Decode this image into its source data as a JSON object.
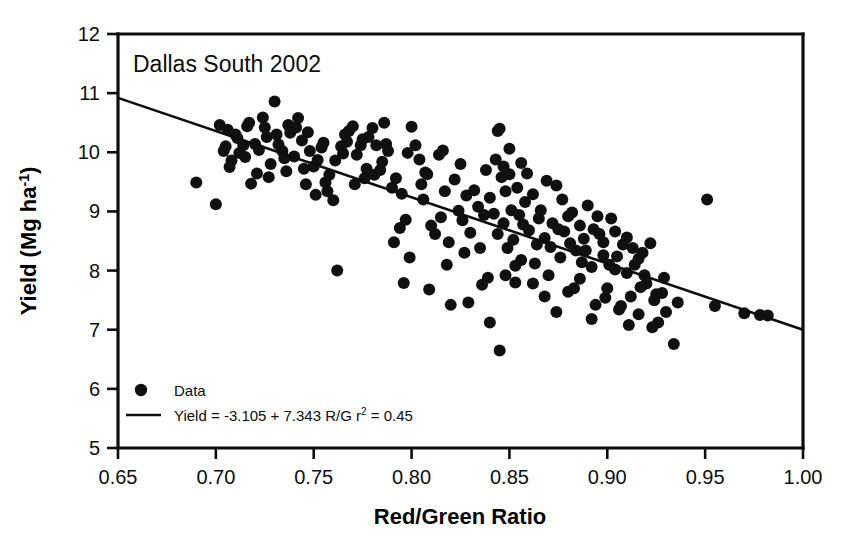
{
  "chart_data": {
    "type": "scatter",
    "title": "Dallas South 2002",
    "xlabel": "Red/Green Ratio",
    "ylabel": "Yield (Mg ha",
    "ylabel_sup": "-1",
    "ylabel_close": ")",
    "xlim": [
      0.65,
      1.0
    ],
    "ylim": [
      5,
      12
    ],
    "xticks": [
      0.65,
      0.7,
      0.75,
      0.8,
      0.85,
      0.9,
      0.95,
      1.0
    ],
    "xticklabels": [
      "0.65",
      "0.70",
      "0.75",
      "0.80",
      "0.85",
      "0.90",
      "0.95",
      "1.00"
    ],
    "yticks": [
      5,
      6,
      7,
      8,
      9,
      10,
      11,
      12
    ],
    "yticklabels": [
      "5",
      "6",
      "7",
      "8",
      "9",
      "10",
      "11",
      "12"
    ],
    "grid": false,
    "legend_position": "lower-left-inside",
    "legend": [
      {
        "marker": "circle",
        "label": "Data"
      },
      {
        "marker": "line",
        "label": "Yield = -3.105 + 7.343 R/G r",
        "sup": "2",
        "label_tail": " = 0.45"
      }
    ],
    "fit": {
      "intercept": -3.105,
      "slope": 7.343,
      "r_squared": 0.45,
      "equation_text": "Yield = -3.105 + 7.343 R/G r2 = 0.45",
      "line_endpoints": [
        [
          0.65,
          10.92
        ],
        [
          1.0,
          7.0
        ]
      ]
    },
    "series": [
      {
        "name": "Data",
        "marker": "filled-circle",
        "color": "#101010",
        "points": [
          [
            0.69,
            9.49
          ],
          [
            0.7,
            9.12
          ],
          [
            0.702,
            10.46
          ],
          [
            0.704,
            10.02
          ],
          [
            0.706,
            10.38
          ],
          [
            0.708,
            9.86
          ],
          [
            0.71,
            10.3
          ],
          [
            0.712,
            9.99
          ],
          [
            0.714,
            10.12
          ],
          [
            0.716,
            10.44
          ],
          [
            0.718,
            9.47
          ],
          [
            0.72,
            10.14
          ],
          [
            0.722,
            10.04
          ],
          [
            0.724,
            10.59
          ],
          [
            0.726,
            10.26
          ],
          [
            0.728,
            9.8
          ],
          [
            0.73,
            10.86
          ],
          [
            0.732,
            10.13
          ],
          [
            0.734,
            10.02
          ],
          [
            0.736,
            9.68
          ],
          [
            0.738,
            10.33
          ],
          [
            0.74,
            9.93
          ],
          [
            0.742,
            10.58
          ],
          [
            0.744,
            10.2
          ],
          [
            0.746,
            9.46
          ],
          [
            0.748,
            10.02
          ],
          [
            0.75,
            9.76
          ],
          [
            0.752,
            9.87
          ],
          [
            0.754,
            10.08
          ],
          [
            0.756,
            9.49
          ],
          [
            0.758,
            9.62
          ],
          [
            0.76,
            9.19
          ],
          [
            0.762,
            8.0
          ],
          [
            0.764,
            10.1
          ],
          [
            0.766,
            10.3
          ],
          [
            0.768,
            10.36
          ],
          [
            0.77,
            10.44
          ],
          [
            0.772,
            9.96
          ],
          [
            0.774,
            10.12
          ],
          [
            0.776,
            9.56
          ],
          [
            0.778,
            10.26
          ],
          [
            0.78,
            10.41
          ],
          [
            0.782,
            10.12
          ],
          [
            0.784,
            9.7
          ],
          [
            0.786,
            10.5
          ],
          [
            0.788,
            10.02
          ],
          [
            0.79,
            9.4
          ],
          [
            0.792,
            9.56
          ],
          [
            0.794,
            8.72
          ],
          [
            0.796,
            7.79
          ],
          [
            0.798,
            9.99
          ],
          [
            0.8,
            10.43
          ],
          [
            0.802,
            10.12
          ],
          [
            0.804,
            9.88
          ],
          [
            0.806,
            9.2
          ],
          [
            0.808,
            9.63
          ],
          [
            0.81,
            8.76
          ],
          [
            0.812,
            8.62
          ],
          [
            0.814,
            9.96
          ],
          [
            0.816,
            10.03
          ],
          [
            0.818,
            8.1
          ],
          [
            0.82,
            7.42
          ],
          [
            0.822,
            9.54
          ],
          [
            0.824,
            9.01
          ],
          [
            0.826,
            8.85
          ],
          [
            0.828,
            9.27
          ],
          [
            0.83,
            8.64
          ],
          [
            0.832,
            9.36
          ],
          [
            0.834,
            9.08
          ],
          [
            0.836,
            7.76
          ],
          [
            0.838,
            9.7
          ],
          [
            0.84,
            9.23
          ],
          [
            0.842,
            8.96
          ],
          [
            0.844,
            10.36
          ],
          [
            0.845,
            10.4
          ],
          [
            0.846,
            9.58
          ],
          [
            0.847,
            8.8
          ],
          [
            0.848,
            9.34
          ],
          [
            0.849,
            8.38
          ],
          [
            0.85,
            9.63
          ],
          [
            0.851,
            9.02
          ],
          [
            0.852,
            8.52
          ],
          [
            0.853,
            7.8
          ],
          [
            0.854,
            9.4
          ],
          [
            0.855,
            8.94
          ],
          [
            0.856,
            8.18
          ],
          [
            0.845,
            6.65
          ],
          [
            0.84,
            7.12
          ],
          [
            0.858,
            9.16
          ],
          [
            0.86,
            8.68
          ],
          [
            0.862,
            9.29
          ],
          [
            0.864,
            8.44
          ],
          [
            0.866,
            9.02
          ],
          [
            0.868,
            8.55
          ],
          [
            0.87,
            7.92
          ],
          [
            0.872,
            8.8
          ],
          [
            0.874,
            9.44
          ],
          [
            0.876,
            8.22
          ],
          [
            0.878,
            8.66
          ],
          [
            0.88,
            7.64
          ],
          [
            0.882,
            8.98
          ],
          [
            0.884,
            8.34
          ],
          [
            0.886,
            7.86
          ],
          [
            0.888,
            8.54
          ],
          [
            0.89,
            9.1
          ],
          [
            0.892,
            8.06
          ],
          [
            0.894,
            7.42
          ],
          [
            0.896,
            8.62
          ],
          [
            0.898,
            8.26
          ],
          [
            0.9,
            7.7
          ],
          [
            0.902,
            8.88
          ],
          [
            0.904,
            8.02
          ],
          [
            0.906,
            7.34
          ],
          [
            0.908,
            8.44
          ],
          [
            0.91,
            7.96
          ],
          [
            0.912,
            7.56
          ],
          [
            0.914,
            8.1
          ],
          [
            0.916,
            7.26
          ],
          [
            0.918,
            8.3
          ],
          [
            0.92,
            7.78
          ],
          [
            0.922,
            8.46
          ],
          [
            0.924,
            7.5
          ],
          [
            0.926,
            7.12
          ],
          [
            0.928,
            7.62
          ],
          [
            0.93,
            7.3
          ],
          [
            0.934,
            6.76
          ],
          [
            0.936,
            7.46
          ],
          [
            0.951,
            9.2
          ],
          [
            0.955,
            7.4
          ],
          [
            0.97,
            7.28
          ],
          [
            0.978,
            7.25
          ],
          [
            0.982,
            7.24
          ],
          [
            0.705,
            10.1
          ],
          [
            0.715,
            9.92
          ],
          [
            0.725,
            10.42
          ],
          [
            0.735,
            9.9
          ],
          [
            0.745,
            9.72
          ],
          [
            0.755,
            10.16
          ],
          [
            0.765,
            9.98
          ],
          [
            0.775,
            10.22
          ],
          [
            0.785,
            9.84
          ],
          [
            0.795,
            9.3
          ],
          [
            0.805,
            9.46
          ],
          [
            0.815,
            8.9
          ],
          [
            0.825,
            9.8
          ],
          [
            0.835,
            8.38
          ],
          [
            0.843,
            9.88
          ],
          [
            0.857,
            8.78
          ],
          [
            0.863,
            8.12
          ],
          [
            0.869,
            9.52
          ],
          [
            0.875,
            8.7
          ],
          [
            0.881,
            8.46
          ],
          [
            0.887,
            8.14
          ],
          [
            0.893,
            8.7
          ],
          [
            0.899,
            7.54
          ],
          [
            0.905,
            8.24
          ],
          [
            0.911,
            7.08
          ],
          [
            0.917,
            7.72
          ],
          [
            0.923,
            7.04
          ],
          [
            0.929,
            7.88
          ],
          [
            0.707,
            9.75
          ],
          [
            0.717,
            10.5
          ],
          [
            0.727,
            9.58
          ],
          [
            0.737,
            10.46
          ],
          [
            0.747,
            10.34
          ],
          [
            0.757,
            9.34
          ],
          [
            0.767,
            10.18
          ],
          [
            0.777,
            9.72
          ],
          [
            0.787,
            10.14
          ],
          [
            0.797,
            8.86
          ],
          [
            0.807,
            9.66
          ],
          [
            0.817,
            9.34
          ],
          [
            0.827,
            8.3
          ],
          [
            0.837,
            8.94
          ],
          [
            0.847,
            9.76
          ],
          [
            0.853,
            8.08
          ],
          [
            0.859,
            9.64
          ],
          [
            0.865,
            8.88
          ],
          [
            0.871,
            8.4
          ],
          [
            0.877,
            9.2
          ],
          [
            0.883,
            7.7
          ],
          [
            0.889,
            8.34
          ],
          [
            0.895,
            8.92
          ],
          [
            0.901,
            8.1
          ],
          [
            0.907,
            7.4
          ],
          [
            0.913,
            8.38
          ],
          [
            0.919,
            7.92
          ],
          [
            0.925,
            7.6
          ],
          [
            0.85,
            10.06
          ],
          [
            0.856,
            9.82
          ],
          [
            0.862,
            7.78
          ],
          [
            0.868,
            7.56
          ],
          [
            0.874,
            7.3
          ],
          [
            0.88,
            8.92
          ],
          [
            0.886,
            8.76
          ],
          [
            0.892,
            7.18
          ],
          [
            0.898,
            8.48
          ],
          [
            0.904,
            8.66
          ],
          [
            0.91,
            8.56
          ],
          [
            0.916,
            8.2
          ],
          [
            0.791,
            8.48
          ],
          [
            0.799,
            8.22
          ],
          [
            0.809,
            7.68
          ],
          [
            0.819,
            8.48
          ],
          [
            0.829,
            7.46
          ],
          [
            0.839,
            7.88
          ],
          [
            0.711,
            10.24
          ],
          [
            0.721,
            9.64
          ],
          [
            0.731,
            10.3
          ],
          [
            0.741,
            10.42
          ],
          [
            0.751,
            9.28
          ],
          [
            0.761,
            9.86
          ],
          [
            0.771,
            9.46
          ],
          [
            0.781,
            9.62
          ],
          [
            0.844,
            8.62
          ],
          [
            0.848,
            7.92
          ]
        ]
      }
    ]
  }
}
